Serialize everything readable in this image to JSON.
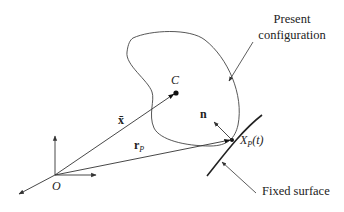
{
  "diagram": {
    "title_label_present": [
      "Present",
      "configuration"
    ],
    "label_fixed_surface": "Fixed surface",
    "points": {
      "origin": {
        "label": "O",
        "x": 55,
        "y": 175
      },
      "center": {
        "label": "C",
        "x": 176,
        "y": 93
      },
      "contact": {
        "label_main": "X",
        "label_sub": "P",
        "label_arg": "(t)",
        "x": 232,
        "y": 140
      }
    },
    "vectors": {
      "x_bar": {
        "label": "x̄",
        "from": "O",
        "to": "C"
      },
      "r_P": {
        "label_main": "r",
        "label_sub": "P",
        "from": "O",
        "to": "X_P(t)"
      },
      "normal": {
        "label": "n",
        "from": "X_P(t)",
        "direction": "up-left"
      }
    },
    "colors": {
      "line": "#333333",
      "text": "#222222",
      "background": "#ffffff"
    }
  }
}
